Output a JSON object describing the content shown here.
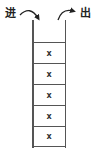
{
  "diagram": {
    "type": "stack",
    "entry_label": "进",
    "exit_label": "出",
    "cells": [
      {
        "value": "x"
      },
      {
        "value": "x"
      },
      {
        "value": "x"
      },
      {
        "value": "x"
      },
      {
        "value": "x"
      }
    ],
    "colors": {
      "line": "#555555",
      "text": "#222222",
      "background": "#ffffff"
    }
  }
}
